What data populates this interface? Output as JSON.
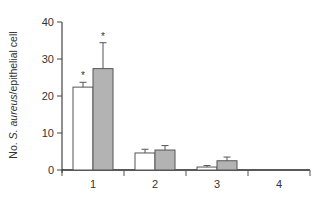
{
  "chart_data": {
    "type": "bar",
    "title": "",
    "xlabel": "",
    "ylabel": "No. S. aureus/epithelial cell",
    "ylabel_parts": {
      "prefix": "No. ",
      "italic": "S. aureus",
      "suffix": "/epithelial cell"
    },
    "categories": [
      "1",
      "2",
      "3",
      "4"
    ],
    "series": [
      {
        "name": "white",
        "color": "#ffffff",
        "values": [
          22.4,
          4.6,
          0.8,
          0.0
        ],
        "errors": [
          1.3,
          1.0,
          0.4,
          0.0
        ]
      },
      {
        "name": "gray",
        "color": "#b3b3b3",
        "values": [
          27.4,
          5.4,
          2.5,
          0.0
        ],
        "errors": [
          7.0,
          1.2,
          1.0,
          0.0
        ]
      }
    ],
    "significance": [
      {
        "category": "1",
        "series": "white",
        "mark": "*"
      },
      {
        "category": "1",
        "series": "gray",
        "mark": "*"
      }
    ],
    "ylim": [
      0,
      40
    ],
    "yticks": [
      0,
      10,
      20,
      30,
      40
    ],
    "grid": false,
    "legend": "none"
  }
}
